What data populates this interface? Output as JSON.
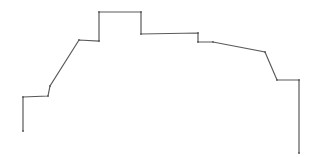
{
  "diagram": {
    "type": "line-sketch",
    "stroke_color": "#5a5a5a",
    "background_color": "#ffffff",
    "stroke_width": 1.2,
    "points": [
      [
        23,
        131
      ],
      [
        23,
        97
      ],
      [
        48,
        96
      ],
      [
        50,
        86
      ],
      [
        79,
        40
      ],
      [
        99,
        41
      ],
      [
        99,
        12
      ],
      [
        141,
        12
      ],
      [
        141,
        34
      ],
      [
        198,
        33
      ],
      [
        198,
        42
      ],
      [
        213,
        42
      ],
      [
        265,
        52
      ],
      [
        277,
        80
      ],
      [
        299,
        80
      ],
      [
        299,
        153
      ]
    ]
  }
}
